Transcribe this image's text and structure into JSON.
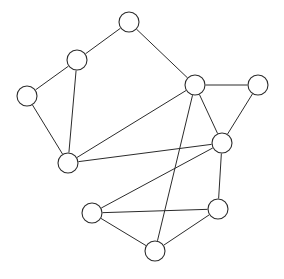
{
  "diagram": {
    "type": "graph",
    "background_color": "#ffffff",
    "stroke_color": "#2b2b2b",
    "node_fill_color": "#ffffff",
    "node_radius": 10,
    "edge_width": 1,
    "node_count": 10,
    "edge_count": 16,
    "width": 284,
    "height": 279
  },
  "chart_data": {
    "type": "graph",
    "title": "",
    "directed": false,
    "weighted": false,
    "labels_shown": false,
    "nodes": [
      {
        "id": "n1",
        "x": 129,
        "y": 22,
        "r": 10,
        "degree": 2
      },
      {
        "id": "n2",
        "x": 77,
        "y": 60,
        "r": 10,
        "degree": 3
      },
      {
        "id": "n3",
        "x": 27,
        "y": 96,
        "r": 10,
        "degree": 2
      },
      {
        "id": "n4",
        "x": 195,
        "y": 85,
        "r": 10,
        "degree": 5
      },
      {
        "id": "n5",
        "x": 258,
        "y": 85,
        "r": 10,
        "degree": 2
      },
      {
        "id": "n6",
        "x": 222,
        "y": 143,
        "r": 10,
        "degree": 5
      },
      {
        "id": "n7",
        "x": 68,
        "y": 163,
        "r": 10,
        "degree": 4
      },
      {
        "id": "n8",
        "x": 92,
        "y": 213,
        "r": 10,
        "degree": 3
      },
      {
        "id": "n9",
        "x": 218,
        "y": 209,
        "r": 10,
        "degree": 3
      },
      {
        "id": "n10",
        "x": 155,
        "y": 251,
        "r": 10,
        "degree": 3
      }
    ],
    "edges": [
      {
        "source": "n1",
        "target": "n2"
      },
      {
        "source": "n1",
        "target": "n4"
      },
      {
        "source": "n2",
        "target": "n3"
      },
      {
        "source": "n2",
        "target": "n7"
      },
      {
        "source": "n3",
        "target": "n7"
      },
      {
        "source": "n4",
        "target": "n5"
      },
      {
        "source": "n4",
        "target": "n6"
      },
      {
        "source": "n4",
        "target": "n7"
      },
      {
        "source": "n4",
        "target": "n10"
      },
      {
        "source": "n5",
        "target": "n6"
      },
      {
        "source": "n6",
        "target": "n7"
      },
      {
        "source": "n6",
        "target": "n8"
      },
      {
        "source": "n6",
        "target": "n9"
      },
      {
        "source": "n8",
        "target": "n9"
      },
      {
        "source": "n8",
        "target": "n10"
      },
      {
        "source": "n9",
        "target": "n10"
      }
    ]
  }
}
